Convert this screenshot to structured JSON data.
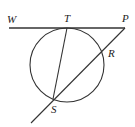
{
  "diagram": {
    "type": "geometry",
    "colors": {
      "stroke": "#333333",
      "label": "#222222",
      "background": "#ffffff"
    },
    "labels": {
      "W": "W",
      "T": "T",
      "P": "P",
      "R": "R",
      "S": "S"
    },
    "points": {
      "W": [
        9,
        28
      ],
      "T": [
        67,
        28
      ],
      "P": [
        125,
        28
      ],
      "R": [
        103,
        50
      ],
      "S": [
        53,
        99
      ]
    },
    "circle": {
      "cx": 67,
      "cy": 65,
      "r": 37
    },
    "segments": [
      {
        "name": "tangent-WP",
        "from": "W",
        "to": "P"
      },
      {
        "name": "chord-TS",
        "from": "T",
        "to": "S"
      },
      {
        "name": "secant-PS",
        "from": "P",
        "to": "S",
        "extends_to": [
          31,
          123
        ]
      }
    ]
  }
}
